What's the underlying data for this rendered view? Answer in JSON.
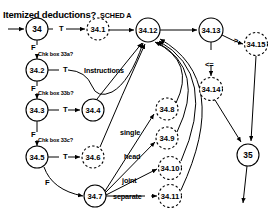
{
  "title": "Itemized deductions?",
  "diagram": {
    "type": "flowchart",
    "style": {
      "node_fill": "#ffffff",
      "stroke": "#000000",
      "text": "#000000"
    },
    "nodes": [
      {
        "id": "n34",
        "label": "34",
        "x": 37,
        "y": 29,
        "r": 11,
        "border": "solid",
        "size": "big"
      },
      {
        "id": "n34_1",
        "label": "34.1",
        "x": 98,
        "y": 29,
        "r": 11,
        "border": "dashed",
        "size": "normal"
      },
      {
        "id": "n34_12",
        "label": "34.12",
        "x": 148,
        "y": 30,
        "r": 12,
        "border": "solid",
        "size": "normal"
      },
      {
        "id": "n34_13",
        "label": "34.13",
        "x": 211,
        "y": 30,
        "r": 12,
        "border": "solid",
        "size": "normal"
      },
      {
        "id": "n34_15",
        "label": "34.15",
        "x": 256,
        "y": 44,
        "r": 11.5,
        "border": "dashed",
        "size": "normal"
      },
      {
        "id": "n34_14",
        "label": "34.14",
        "x": 211,
        "y": 89,
        "r": 11.5,
        "border": "dashed",
        "size": "normal"
      },
      {
        "id": "n34_2",
        "label": "34.2",
        "x": 37,
        "y": 70,
        "r": 11,
        "border": "solid",
        "size": "normal"
      },
      {
        "id": "n34_3",
        "label": "34.3",
        "x": 37,
        "y": 110,
        "r": 11,
        "border": "solid",
        "size": "normal"
      },
      {
        "id": "n34_4",
        "label": "34.4",
        "x": 93,
        "y": 110,
        "r": 11,
        "border": "solid",
        "size": "normal"
      },
      {
        "id": "n34_5",
        "label": "34.5",
        "x": 37,
        "y": 157,
        "r": 11,
        "border": "solid",
        "size": "normal"
      },
      {
        "id": "n34_6",
        "label": "34.6",
        "x": 93,
        "y": 157,
        "r": 11,
        "border": "dashed",
        "size": "normal"
      },
      {
        "id": "n34_7",
        "label": "34.7",
        "x": 95,
        "y": 196,
        "r": 11,
        "border": "solid",
        "size": "normal"
      },
      {
        "id": "n34_8",
        "label": "34.8",
        "x": 167,
        "y": 109,
        "r": 11,
        "border": "dashed",
        "size": "normal"
      },
      {
        "id": "n34_9",
        "label": "34.9",
        "x": 167,
        "y": 138,
        "r": 11,
        "border": "dashed",
        "size": "normal"
      },
      {
        "id": "n34_10",
        "label": "34.10",
        "x": 170,
        "y": 168,
        "r": 11.5,
        "border": "dashed",
        "size": "normal"
      },
      {
        "id": "n34_11",
        "label": "34.11",
        "x": 170,
        "y": 196,
        "r": 11.5,
        "border": "dashed",
        "size": "normal"
      },
      {
        "id": "n35",
        "label": "35",
        "x": 248,
        "y": 155,
        "r": 11,
        "border": "solid",
        "size": "big"
      }
    ],
    "edge_labels": [
      {
        "id": "lbl-sched-a",
        "text": "SCHED A",
        "x": 100,
        "y": 11,
        "cls": "lbl"
      },
      {
        "id": "lbl-t-34",
        "text": "T",
        "x": 59,
        "y": 24,
        "cls": "lbl tf"
      },
      {
        "id": "lbl-f-34",
        "text": "F",
        "x": 31,
        "y": 43,
        "cls": "lbl tf"
      },
      {
        "id": "lbl-chk-33a",
        "text": "Chk box 33a?",
        "x": 38,
        "y": 51,
        "cls": "lbl sm"
      },
      {
        "id": "lbl-t-342",
        "text": "T",
        "x": 63,
        "y": 65,
        "cls": "lbl tf"
      },
      {
        "id": "lbl-f-342",
        "text": "F",
        "x": 31,
        "y": 84,
        "cls": "lbl tf"
      },
      {
        "id": "lbl-chk-33b",
        "text": "Chk box 33b?",
        "x": 38,
        "y": 90,
        "cls": "lbl sm"
      },
      {
        "id": "lbl-instructions",
        "text": "Instructions",
        "x": 84,
        "y": 66,
        "cls": "lbl"
      },
      {
        "id": "lbl-t-343",
        "text": "T",
        "x": 63,
        "y": 105,
        "cls": "lbl tf"
      },
      {
        "id": "lbl-f-343",
        "text": "F",
        "x": 31,
        "y": 130,
        "cls": "lbl tf"
      },
      {
        "id": "lbl-chk-33c",
        "text": "Chk box 33c?",
        "x": 38,
        "y": 137,
        "cls": "lbl sm"
      },
      {
        "id": "lbl-t-345",
        "text": "T",
        "x": 63,
        "y": 152,
        "cls": "lbl tf"
      },
      {
        "id": "lbl-f-345",
        "text": "F",
        "x": 45,
        "y": 178,
        "cls": "lbl tf"
      },
      {
        "id": "lbl-single",
        "text": "single",
        "x": 120,
        "y": 128,
        "cls": "lbl"
      },
      {
        "id": "lbl-head",
        "text": "head",
        "x": 124,
        "y": 152,
        "cls": "lbl"
      },
      {
        "id": "lbl-joint",
        "text": "joint",
        "x": 122,
        "y": 176,
        "cls": "lbl"
      },
      {
        "id": "lbl-separate",
        "text": "separate",
        "x": 113,
        "y": 192,
        "cls": "lbl"
      },
      {
        "id": "lbl-gt",
        "text": ">",
        "x": 234,
        "y": 36,
        "cls": "lbl tf"
      },
      {
        "id": "lbl-lte",
        "text": "<=",
        "x": 205,
        "y": 60,
        "cls": "lbl tf"
      }
    ]
  }
}
